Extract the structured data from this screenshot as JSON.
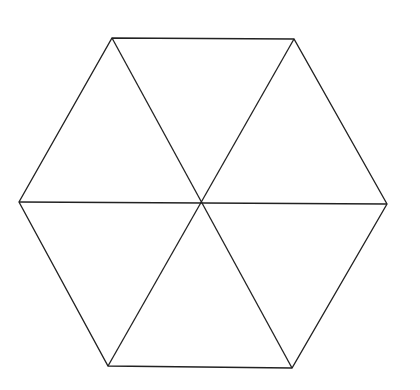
{
  "diagram": {
    "type": "regular-hexagon-divided-into-triangles",
    "stroke_color": "#222222",
    "background": "#ffffff",
    "vertices": {
      "top_left": [
        112,
        38
      ],
      "top_right": [
        294,
        39
      ],
      "right": [
        387,
        204
      ],
      "bottom_right": [
        292,
        368
      ],
      "bottom_left": [
        108,
        366
      ],
      "left": [
        19,
        202
      ]
    },
    "center": [
      201,
      202
    ],
    "triangle_count": 6
  }
}
